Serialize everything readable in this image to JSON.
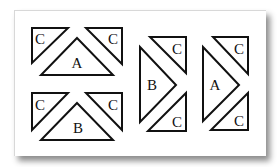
{
  "diagram": {
    "colors": {
      "stroke": "#111111",
      "card_background": "#ffffff",
      "page_background": "#ffffff"
    },
    "groups": [
      {
        "id": "top-left",
        "orientation": "pointing-up",
        "pieces": [
          {
            "label": "C",
            "role": "corner-left"
          },
          {
            "label": "A",
            "role": "center"
          },
          {
            "label": "C",
            "role": "corner-right"
          }
        ]
      },
      {
        "id": "bottom-left",
        "orientation": "pointing-up",
        "pieces": [
          {
            "label": "C",
            "role": "corner-left"
          },
          {
            "label": "B",
            "role": "center"
          },
          {
            "label": "C",
            "role": "corner-right"
          }
        ]
      },
      {
        "id": "middle-right",
        "orientation": "pointing-right",
        "pieces": [
          {
            "label": "C",
            "role": "corner-top"
          },
          {
            "label": "B",
            "role": "center"
          },
          {
            "label": "C",
            "role": "corner-bottom"
          }
        ]
      },
      {
        "id": "far-right",
        "orientation": "pointing-right",
        "pieces": [
          {
            "label": "C",
            "role": "corner-top"
          },
          {
            "label": "A",
            "role": "center"
          },
          {
            "label": "C",
            "role": "corner-bottom"
          }
        ]
      }
    ]
  }
}
